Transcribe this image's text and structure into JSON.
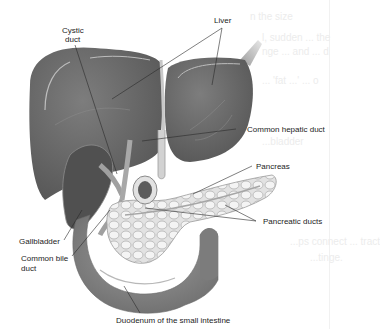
{
  "figure": {
    "type": "anatomical-illustration",
    "colors": {
      "background": "#ffffff",
      "liver": "#6e6e6e",
      "liver_shadow": "#5a5a5a",
      "pancreas": "#d9d9d9",
      "duodenum": "#8a8a8a",
      "leader_line": "#2a2a2a",
      "label_text": "#1c1c1c"
    },
    "labels": {
      "liver": "Liver",
      "cystic_duct_line1": "Cystic",
      "cystic_duct_line2": "duct",
      "common_hepatic_duct": "Common hepatic duct",
      "pancreas": "Pancreas",
      "pancreatic_ducts": "Pancreatic ducts",
      "gallbladder": "Gallbladder",
      "common_bile_duct_line1": "Common bile",
      "common_bile_duct_line2": "duct",
      "duodenum": "Duodenum of the small intestine"
    }
  },
  "bleed_through_text": {
    "line1": "n the size",
    "line2": "l, sudden ... the",
    "line3": "nge ... and ... d",
    "line4": "... 'fat ...' ... o",
    "line5": "...bladder",
    "line6": "...ps connect ... tract",
    "line7": "...tinge."
  }
}
